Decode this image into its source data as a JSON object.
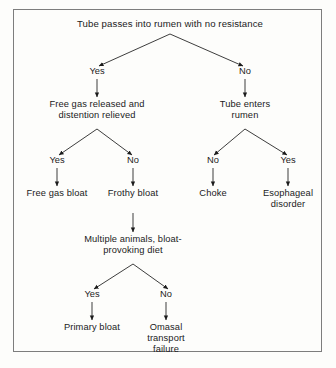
{
  "diagram": {
    "type": "decision-flowchart",
    "title": "Tube passes into rumen with no resistance",
    "nodes": {
      "root": "Tube passes into rumen with no resistance",
      "free_gas_released": "Free gas released and distention relieved",
      "tube_enters_rumen": "Tube enters rumen",
      "free_gas_bloat": "Free gas bloat",
      "frothy_bloat": "Frothy bloat",
      "choke": "Choke",
      "esophageal_disorder": "Esophageal disorder",
      "multiple_animals": "Multiple animals, bloat-provoking diet",
      "primary_bloat": "Primary bloat",
      "omasal_transport_failure": "Omasal transport failure"
    },
    "edge_labels": {
      "root_yes": "Yes",
      "root_no": "No",
      "free_gas_yes": "Yes",
      "free_gas_no": "No",
      "tube_no": "No",
      "tube_yes": "Yes",
      "multiple_yes": "Yes",
      "multiple_no": "No"
    },
    "colors": {
      "background": "#fdfdfb",
      "border": "#7d7d7d",
      "text": "#1b1b1b",
      "line": "#1b1b1b"
    }
  }
}
